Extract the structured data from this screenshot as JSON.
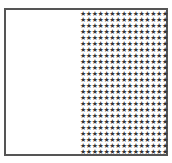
{
  "figure": {
    "star_grid": {
      "icon": "star-icon",
      "glyph": "★",
      "columns": 15,
      "rows": 24,
      "color": "#333333"
    },
    "frame_color": "#555555",
    "empty_region_color": "#ffffff"
  }
}
